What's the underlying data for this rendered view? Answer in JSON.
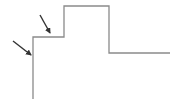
{
  "diagram": {
    "type": "step-profile-with-arrows",
    "colors": {
      "line": "#8a8a8a",
      "arrow": "#333333",
      "background": "#ffffff"
    },
    "profile_points": [
      [
        33,
        99
      ],
      [
        33,
        37
      ],
      [
        64,
        37
      ],
      [
        64,
        6
      ],
      [
        109,
        6
      ],
      [
        109,
        53
      ],
      [
        170,
        53
      ]
    ],
    "arrows": [
      {
        "from": [
          13,
          41
        ],
        "to": [
          31,
          55
        ],
        "label": ""
      },
      {
        "from": [
          40,
          15
        ],
        "to": [
          50,
          33
        ],
        "label": ""
      }
    ]
  }
}
